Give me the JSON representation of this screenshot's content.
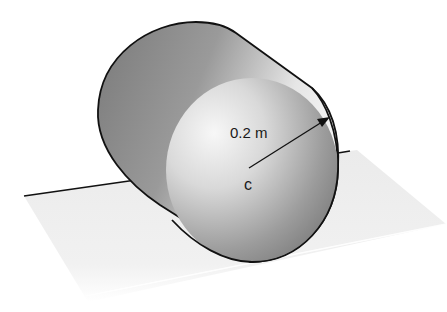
{
  "diagram": {
    "type": "physics-illustration",
    "labels": {
      "radius": "0.2 m",
      "center": "c"
    },
    "colors": {
      "outline": "#111111",
      "body_dark": "#6e6e6e",
      "body_light": "#f2f2f2",
      "plane": "#ececec",
      "background": "#ffffff"
    }
  }
}
